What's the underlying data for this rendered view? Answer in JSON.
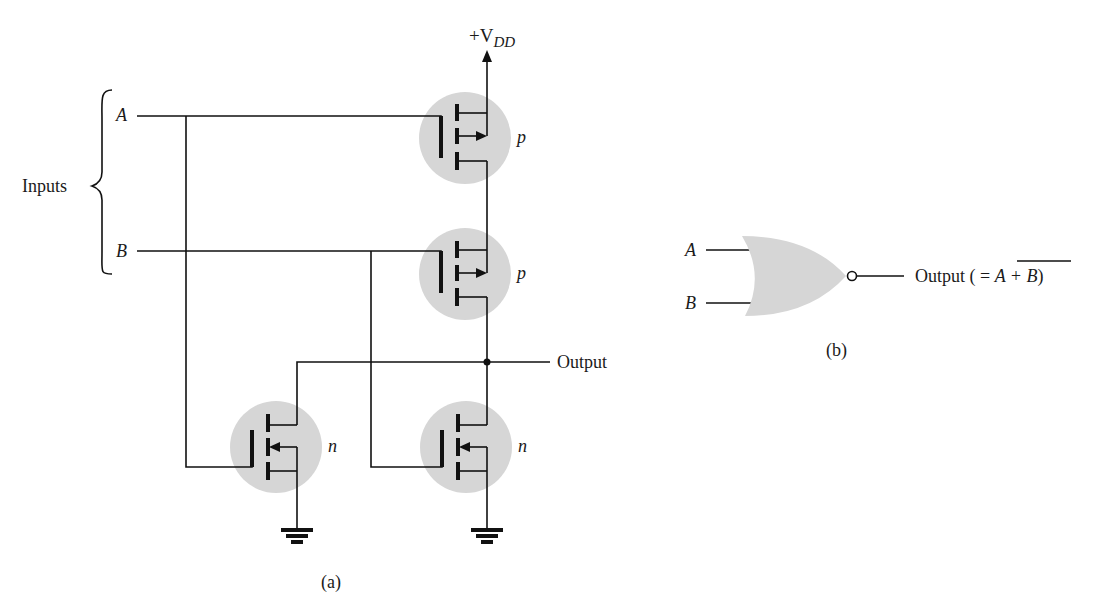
{
  "figure_a": {
    "supply_label": "+V",
    "supply_subscript": "DD",
    "inputs_label": "Inputs",
    "input_a": "A",
    "input_b": "B",
    "output_label": "Output",
    "transistors": [
      {
        "id": "p-top",
        "type": "p"
      },
      {
        "id": "p-bottom",
        "type": "p"
      },
      {
        "id": "n-left",
        "type": "n"
      },
      {
        "id": "n-right",
        "type": "n"
      }
    ],
    "caption": "(a)"
  },
  "figure_b": {
    "gate": "NOR",
    "input_a": "A",
    "input_b": "B",
    "output_prefix": "Output ( = ",
    "output_expr": "A + B",
    "output_suffix": ")",
    "caption": "(b)"
  },
  "colors": {
    "ink": "#111111",
    "shade": "#d6d6d6",
    "background": "#ffffff"
  }
}
